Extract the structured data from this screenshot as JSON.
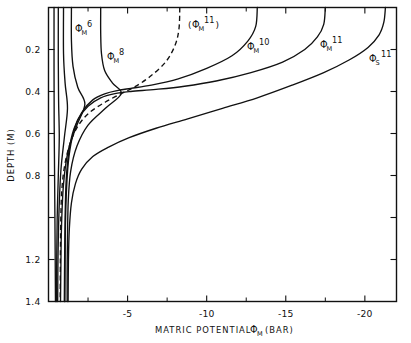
{
  "chart_data": {
    "type": "line",
    "title": "",
    "xlabel": "MATRIC POTENTIAL  ΦM (BAR)",
    "ylabel": "DEPTH (M)",
    "xlabel_parts": {
      "main": "MATRIC POTENTIAL",
      "symbol": "Φ",
      "symbol_sub": "M",
      "unit": "(BAR)"
    },
    "xlim": [
      0,
      -22.0
    ],
    "ylim": [
      0,
      1.4
    ],
    "y_inverted": true,
    "grid": false,
    "legend": "none (curves labelled in-place)",
    "x_ticks_major": [
      -5,
      -10,
      -15,
      -20
    ],
    "x_ticklabels": [
      "-5",
      "-10",
      "-15",
      "-20"
    ],
    "x_ticks_minor": [
      -2.5,
      -7.5,
      -12.5,
      -17.5
    ],
    "y_ticks_major": [
      0.2,
      0.4,
      0.6,
      0.8,
      1.0,
      1.2,
      1.4
    ],
    "y_ticklabels": [
      "0.2",
      "0.4",
      "0.6",
      "0.8",
      "",
      "1.2",
      "1.4"
    ],
    "series": [
      {
        "name": "run-a",
        "label": "",
        "symbol": "",
        "sub": "",
        "sup": "",
        "style": "solid",
        "points": [
          [
            -0.35,
            0.0
          ],
          [
            -0.35,
            0.3
          ],
          [
            -0.36,
            0.55
          ],
          [
            -0.38,
            0.75
          ],
          [
            -0.4,
            0.95
          ],
          [
            -0.42,
            1.15
          ],
          [
            -0.44,
            1.4
          ]
        ]
      },
      {
        "name": "run-b",
        "label": "",
        "symbol": "",
        "sub": "",
        "sup": "",
        "style": "solid",
        "points": [
          [
            -0.62,
            0.0
          ],
          [
            -0.62,
            0.26
          ],
          [
            -0.64,
            0.45
          ],
          [
            -0.68,
            0.62
          ],
          [
            -0.62,
            0.8
          ],
          [
            -0.55,
            1.0
          ],
          [
            -0.52,
            1.2
          ],
          [
            -0.5,
            1.4
          ]
        ]
      },
      {
        "name": "run-c",
        "label": "",
        "symbol": "",
        "sub": "",
        "sup": "",
        "style": "solid",
        "points": [
          [
            -0.95,
            0.0
          ],
          [
            -0.95,
            0.22
          ],
          [
            -1.05,
            0.36
          ],
          [
            -1.2,
            0.48
          ],
          [
            -1.0,
            0.62
          ],
          [
            -0.78,
            0.78
          ],
          [
            -0.66,
            0.98
          ],
          [
            -0.6,
            1.2
          ],
          [
            -0.58,
            1.4
          ]
        ]
      },
      {
        "name": "phiM6",
        "label": "ΦM 6",
        "symbol": "Φ",
        "sub": "M",
        "sup": "6",
        "style": "solid",
        "points": [
          [
            -1.45,
            0.0
          ],
          [
            -1.45,
            0.16
          ],
          [
            -1.55,
            0.28
          ],
          [
            -1.85,
            0.38
          ],
          [
            -2.3,
            0.46
          ],
          [
            -1.8,
            0.56
          ],
          [
            -1.25,
            0.68
          ],
          [
            -0.95,
            0.84
          ],
          [
            -0.82,
            1.05
          ],
          [
            -0.78,
            1.25
          ],
          [
            -0.76,
            1.4
          ]
        ]
      },
      {
        "name": "phiM8",
        "label": "ΦM 8",
        "symbol": "Φ",
        "sub": "M",
        "sup": "8",
        "style": "solid",
        "points": [
          [
            -3.3,
            0.0
          ],
          [
            -3.3,
            0.12
          ],
          [
            -3.35,
            0.22
          ],
          [
            -3.55,
            0.3
          ],
          [
            -4.05,
            0.36
          ],
          [
            -4.6,
            0.41
          ],
          [
            -3.6,
            0.48
          ],
          [
            -2.5,
            0.56
          ],
          [
            -1.8,
            0.66
          ],
          [
            -1.4,
            0.78
          ],
          [
            -1.25,
            0.92
          ],
          [
            -1.2,
            1.1
          ],
          [
            -1.18,
            1.25
          ],
          [
            -1.18,
            1.4
          ]
        ]
      },
      {
        "name": "phiM11-dashed",
        "label": "(ΦM 11)",
        "symbol": "Φ",
        "sub": "M",
        "sup": "11",
        "style": "dashed",
        "parenthesized": true,
        "points": [
          [
            -8.3,
            0.0
          ],
          [
            -8.25,
            0.1
          ],
          [
            -8.0,
            0.18
          ],
          [
            -7.4,
            0.26
          ],
          [
            -6.4,
            0.33
          ],
          [
            -5.4,
            0.38
          ],
          [
            -4.6,
            0.41
          ],
          [
            -3.6,
            0.45
          ],
          [
            -2.6,
            0.5
          ],
          [
            -1.9,
            0.56
          ],
          [
            -1.4,
            0.64
          ],
          [
            -1.05,
            0.74
          ],
          [
            -0.85,
            0.86
          ],
          [
            -0.78,
            1.0
          ],
          [
            -0.75,
            1.2
          ],
          [
            -0.74,
            1.4
          ]
        ]
      },
      {
        "name": "phiM10",
        "label": "ΦM 10",
        "symbol": "Φ",
        "sub": "M",
        "sup": "10",
        "style": "solid",
        "points": [
          [
            -13.2,
            0.0
          ],
          [
            -13.1,
            0.09
          ],
          [
            -12.6,
            0.16
          ],
          [
            -11.6,
            0.23
          ],
          [
            -10.0,
            0.29
          ],
          [
            -8.2,
            0.34
          ],
          [
            -6.5,
            0.37
          ],
          [
            -5.2,
            0.385
          ],
          [
            -4.4,
            0.395
          ],
          [
            -3.6,
            0.41
          ],
          [
            -2.8,
            0.44
          ],
          [
            -2.1,
            0.5
          ],
          [
            -1.6,
            0.58
          ],
          [
            -1.3,
            0.68
          ],
          [
            -1.12,
            0.82
          ],
          [
            -1.05,
            1.0
          ],
          [
            -1.02,
            1.2
          ],
          [
            -1.0,
            1.4
          ]
        ]
      },
      {
        "name": "phiM11",
        "label": "ΦM 11",
        "symbol": "Φ",
        "sub": "M",
        "sup": "11",
        "style": "solid",
        "points": [
          [
            -17.5,
            0.0
          ],
          [
            -17.4,
            0.08
          ],
          [
            -17.0,
            0.14
          ],
          [
            -16.2,
            0.2
          ],
          [
            -14.8,
            0.26
          ],
          [
            -12.8,
            0.31
          ],
          [
            -10.6,
            0.35
          ],
          [
            -8.6,
            0.375
          ],
          [
            -6.8,
            0.39
          ],
          [
            -5.2,
            0.4
          ],
          [
            -4.2,
            0.41
          ],
          [
            -3.3,
            0.43
          ],
          [
            -2.5,
            0.47
          ],
          [
            -1.9,
            0.53
          ],
          [
            -1.5,
            0.62
          ],
          [
            -1.25,
            0.74
          ],
          [
            -1.12,
            0.9
          ],
          [
            -1.06,
            1.1
          ],
          [
            -1.04,
            1.4
          ]
        ]
      },
      {
        "name": "phiS11",
        "label": "ΦS 11",
        "symbol": "Φ",
        "sub": "S",
        "sup": "11",
        "style": "solid",
        "points": [
          [
            -21.3,
            0.0
          ],
          [
            -21.2,
            0.07
          ],
          [
            -20.9,
            0.13
          ],
          [
            -20.2,
            0.19
          ],
          [
            -19.0,
            0.25
          ],
          [
            -17.4,
            0.31
          ],
          [
            -15.4,
            0.37
          ],
          [
            -13.2,
            0.43
          ],
          [
            -11.0,
            0.48
          ],
          [
            -8.8,
            0.53
          ],
          [
            -6.8,
            0.575
          ],
          [
            -5.1,
            0.62
          ],
          [
            -3.8,
            0.665
          ],
          [
            -2.8,
            0.71
          ],
          [
            -2.1,
            0.77
          ],
          [
            -1.7,
            0.84
          ],
          [
            -1.45,
            0.93
          ],
          [
            -1.32,
            1.05
          ],
          [
            -1.26,
            1.2
          ],
          [
            -1.24,
            1.4
          ]
        ]
      }
    ],
    "annotations": [
      {
        "name": "label-phiM6",
        "symbol": "Φ",
        "sub": "M",
        "sup": "6",
        "paren": false,
        "x": 75,
        "y": 32
      },
      {
        "name": "label-phiM8",
        "symbol": "Φ",
        "sub": "M",
        "sup": "8",
        "paren": false,
        "x": 107,
        "y": 60
      },
      {
        "name": "label-phiM11d",
        "symbol": "Φ",
        "sub": "M",
        "sup": "11",
        "paren": true,
        "x": 188,
        "y": 28
      },
      {
        "name": "label-phiM10",
        "symbol": "Φ",
        "sub": "M",
        "sup": "10",
        "paren": false,
        "x": 247,
        "y": 50
      },
      {
        "name": "label-phiM11",
        "symbol": "Φ",
        "sub": "M",
        "sup": "11",
        "paren": false,
        "x": 320,
        "y": 48
      },
      {
        "name": "label-phiS11",
        "symbol": "Φ",
        "sub": "S",
        "sup": "11",
        "paren": false,
        "x": 369,
        "y": 62
      }
    ]
  },
  "axes": {
    "y_title": "DEPTH (M)",
    "x_title_main": "MATRIC POTENTIAL",
    "x_title_symbol": "Φ",
    "x_title_sub": "M",
    "x_title_unit": "(BAR)",
    "y_labels": [
      "0.2",
      "0.4",
      "0.6",
      "0.8",
      "1.2",
      "1.4"
    ],
    "x_labels": [
      "-5",
      "-10",
      "-15",
      "-20"
    ]
  },
  "colors": {
    "ink": "#111111",
    "paper": "#ffffff"
  }
}
